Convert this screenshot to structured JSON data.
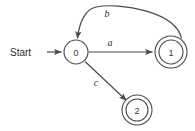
{
  "diagram": {
    "background_color": "#ffffff",
    "stroke_color": "#4a4a4a"
  },
  "start": {
    "label": "Start"
  },
  "states": [
    {
      "id": "0",
      "label": "0",
      "accepting": false,
      "cx": 76,
      "cy": 52,
      "r": 12
    },
    {
      "id": "1",
      "label": "1",
      "accepting": true,
      "cx": 171,
      "cy": 52,
      "r_outer": 16,
      "r_inner": 12
    },
    {
      "id": "2",
      "label": "2",
      "accepting": true,
      "cx": 137,
      "cy": 110,
      "r_outer": 15,
      "r_inner": 11
    }
  ],
  "transitions": [
    {
      "id": "a",
      "label": "a",
      "from": "0",
      "to": "1",
      "shape": "straight",
      "label_x": 110,
      "label_y": 42
    },
    {
      "id": "b",
      "label": "b",
      "from": "1",
      "to": "0",
      "shape": "arc",
      "label_x": 107,
      "label_y": 13
    },
    {
      "id": "c",
      "label": "c",
      "from": "0",
      "to": "2",
      "shape": "straight",
      "label_x": 96,
      "label_y": 82
    }
  ]
}
